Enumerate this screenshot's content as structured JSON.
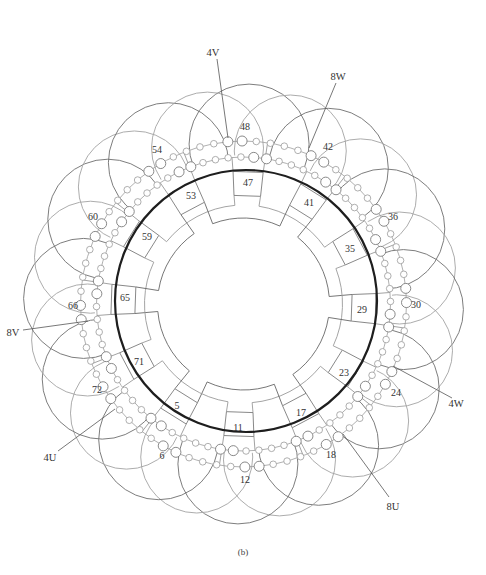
{
  "diagram": {
    "caption": "(b)",
    "inner_slot_labels": [
      "47",
      "41",
      "35",
      "29",
      "23",
      "17",
      "11",
      "5",
      "71",
      "65",
      "59",
      "53"
    ],
    "outer_slot_labels": [
      "48",
      "42",
      "36",
      "30",
      "24",
      "18",
      "12",
      "6",
      "72",
      "66",
      "60",
      "54"
    ],
    "terminals": {
      "t4V": "4V",
      "t8W": "8W",
      "t4W": "4W",
      "t8U": "8U",
      "t4U": "4U",
      "t8V": "8V"
    },
    "colors": {
      "bore": "#1e1e1e",
      "coil_dark": "#6e6e6e",
      "coil_light": "#a3a3a3",
      "text": "#333333"
    }
  }
}
